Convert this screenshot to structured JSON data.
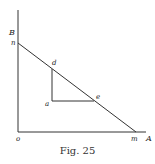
{
  "figure": {
    "caption": "Fig. 25",
    "axis_labels": {
      "vertical": "B",
      "horizontal": "A"
    },
    "points": {
      "origin": {
        "label": "o",
        "x": 18,
        "y": 132
      },
      "n": {
        "label": "n",
        "x": 18,
        "y": 43
      },
      "m": {
        "label": "m",
        "x": 136,
        "y": 132
      },
      "d": {
        "label": "d",
        "x": 52,
        "y": 69
      },
      "a": {
        "label": "a",
        "x": 52,
        "y": 101
      },
      "e": {
        "label": "e",
        "x": 94,
        "y": 101
      }
    },
    "line_color": "#333333"
  }
}
